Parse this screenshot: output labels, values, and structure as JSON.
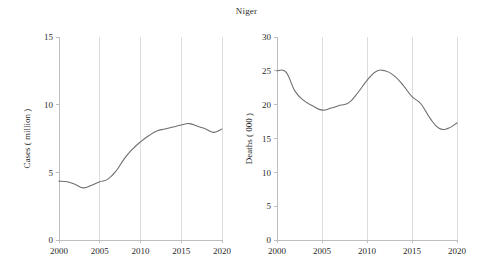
{
  "figure": {
    "title": "Niger",
    "width": 493,
    "height": 274,
    "line_color": "#6e6e6e",
    "grid_color": "#d5d5d5",
    "axis_color": "#bdbdbd"
  },
  "chart_data": [
    {
      "type": "line",
      "id": "cases",
      "title": "Niger",
      "xlabel": "",
      "ylabel": "Cases ( million )",
      "xlim": [
        2000,
        2020
      ],
      "ylim": [
        0,
        15
      ],
      "xticks": [
        2000,
        2005,
        2010,
        2015,
        2020
      ],
      "yticks": [
        0,
        5,
        10,
        15
      ],
      "xticklabels": [
        "2000",
        "2005",
        "2010",
        "2015",
        "2020"
      ],
      "yticklabels": [
        "0",
        "5",
        "10",
        "15"
      ],
      "grid": "vertical",
      "legend": "none",
      "x": [
        2000,
        2001,
        2002,
        2003,
        2004,
        2005,
        2006,
        2007,
        2008,
        2009,
        2010,
        2011,
        2012,
        2013,
        2014,
        2015,
        2016,
        2017,
        2018,
        2019,
        2020
      ],
      "values": [
        4.35,
        4.3,
        4.1,
        3.85,
        4.05,
        4.3,
        4.5,
        5.1,
        6.0,
        6.7,
        7.25,
        7.7,
        8.05,
        8.2,
        8.35,
        8.5,
        8.6,
        8.4,
        8.2,
        7.95,
        8.2
      ],
      "series": [
        {
          "name": "Cases",
          "values": [
            4.35,
            4.3,
            4.1,
            3.85,
            4.05,
            4.3,
            4.5,
            5.1,
            6.0,
            6.7,
            7.25,
            7.7,
            8.05,
            8.2,
            8.35,
            8.5,
            8.6,
            8.4,
            8.2,
            7.95,
            8.2
          ]
        }
      ]
    },
    {
      "type": "line",
      "id": "deaths",
      "title": "Niger",
      "xlabel": "",
      "ylabel": "Deaths ( 000 )",
      "xlim": [
        2000,
        2020
      ],
      "ylim": [
        0,
        30
      ],
      "xticks": [
        2000,
        2005,
        2010,
        2015,
        2020
      ],
      "yticks": [
        0,
        5,
        10,
        15,
        20,
        25,
        30
      ],
      "xticklabels": [
        "2000",
        "2005",
        "2010",
        "2015",
        "2020"
      ],
      "yticklabels": [
        "0",
        "5",
        "10",
        "15",
        "20",
        "25",
        "30"
      ],
      "grid": "vertical",
      "legend": "none",
      "x": [
        2000,
        2001,
        2002,
        2003,
        2004,
        2005,
        2006,
        2007,
        2008,
        2009,
        2010,
        2011,
        2012,
        2013,
        2014,
        2015,
        2016,
        2017,
        2018,
        2019,
        2020
      ],
      "values": [
        25.0,
        24.8,
        22.0,
        20.6,
        19.8,
        19.2,
        19.5,
        19.9,
        20.3,
        21.8,
        23.6,
        24.9,
        25.0,
        24.3,
        22.9,
        21.2,
        20.1,
        18.0,
        16.5,
        16.5,
        17.3
      ],
      "series": [
        {
          "name": "Deaths",
          "values": [
            25.0,
            24.8,
            22.0,
            20.6,
            19.8,
            19.2,
            19.5,
            19.9,
            20.3,
            21.8,
            23.6,
            24.9,
            25.0,
            24.3,
            22.9,
            21.2,
            20.1,
            18.0,
            16.5,
            16.5,
            17.3
          ]
        }
      ]
    }
  ]
}
